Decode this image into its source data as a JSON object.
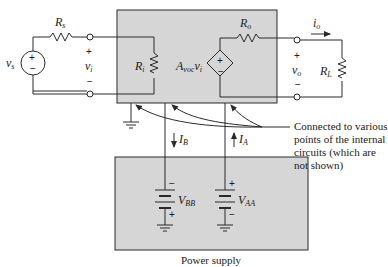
{
  "diagram": {
    "colors": {
      "box_fill": "#d6d6d6",
      "line": "#2a2a2a",
      "background": "#ffffff"
    },
    "source": {
      "voltage_label": "v",
      "voltage_sub": "s",
      "resistor_label": "R",
      "resistor_sub": "s",
      "plus": "+",
      "minus": "−"
    },
    "input": {
      "voltage_label": "v",
      "voltage_sub": "i",
      "plus": "+",
      "minus": "−",
      "resistor_label": "R",
      "resistor_sub": "i"
    },
    "amplifier": {
      "dependent_source_label": "A",
      "dependent_source_sub": "voc",
      "dependent_source_suffix": "v",
      "dependent_source_suffix_sub": "i",
      "output_resistor_label": "R",
      "output_resistor_sub": "o",
      "plus": "+",
      "minus": "−"
    },
    "output": {
      "current_label": "i",
      "current_sub": "o",
      "voltage_label": "v",
      "voltage_sub": "o",
      "plus": "+",
      "minus": "−",
      "load_label": "R",
      "load_sub": "L"
    },
    "supply_currents": {
      "ib_label": "I",
      "ib_sub": "B",
      "ia_label": "I",
      "ia_sub": "A"
    },
    "power_supply": {
      "label": "Power supply",
      "vbb_label": "V",
      "vbb_sub": "BB",
      "vaa_label": "V",
      "vaa_sub": "AA",
      "plus": "+",
      "minus": "−"
    },
    "annotation": {
      "lines": [
        "Connected to various",
        "points of the internal",
        "circuits (which are",
        "not shown)"
      ]
    }
  }
}
